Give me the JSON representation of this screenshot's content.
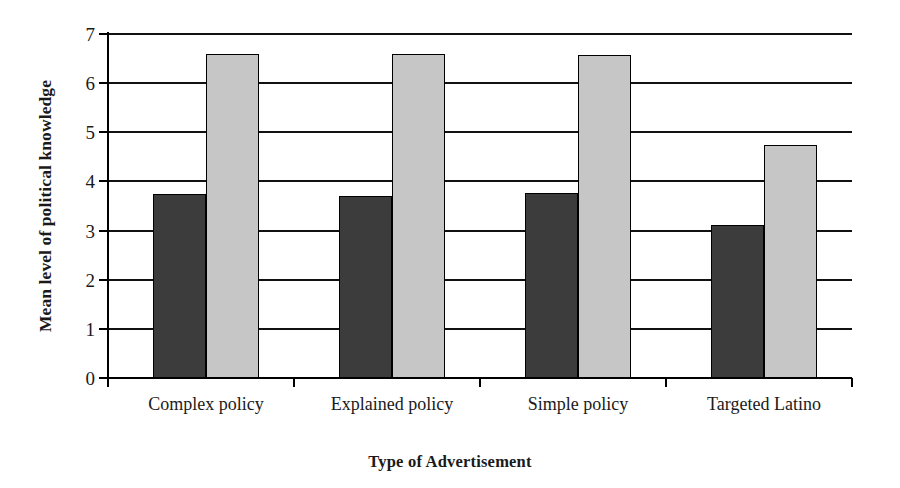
{
  "chart_data": {
    "type": "bar",
    "title": "",
    "xlabel": "Type of Advertisement",
    "ylabel": "Mean level of political knowledge",
    "categories": [
      "Complex policy",
      "Explained policy",
      "Simple policy",
      "Targeted Latino"
    ],
    "series": [
      {
        "name": "dark-series",
        "values": [
          3.75,
          3.7,
          3.77,
          3.12
        ],
        "color": "#3c3c3c"
      },
      {
        "name": "light-series",
        "values": [
          6.6,
          6.6,
          6.57,
          4.75
        ],
        "color": "#c6c6c6"
      }
    ],
    "ylim": [
      0,
      7
    ],
    "ytick_labels": [
      "0",
      "1",
      "2",
      "3",
      "4",
      "5",
      "6",
      "7"
    ],
    "ytick_values": [
      0,
      1,
      2,
      3,
      4,
      5,
      6,
      7
    ],
    "grid": "horizontal",
    "legend": "none",
    "axis_line_color": "#000000"
  }
}
